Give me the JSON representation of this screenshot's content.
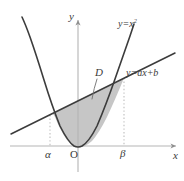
{
  "figure": {
    "type": "math-diagram",
    "background_color": "#ffffff",
    "axes": {
      "x_axis_label": "x",
      "y_axis_label": "y",
      "origin_label": "O",
      "axis_color": "#b0b0b0",
      "origin_px": {
        "x": 78,
        "y": 146
      }
    },
    "curves": {
      "parabola": {
        "label": "y=x",
        "label_exponent": "2",
        "equation": "y = x^2",
        "stroke_color": "#3c3c3c",
        "stroke_width": 1.6
      },
      "line": {
        "label": "y=ax+b",
        "equation": "y = ax + b",
        "stroke_color": "#3c3c3c",
        "stroke_width": 1.6
      }
    },
    "region": {
      "label": "D",
      "fill_color": "#c6c6c6",
      "fill_opacity": 1
    },
    "markers": {
      "left_bound_label": "α",
      "right_bound_label": "β",
      "guide_color": "#bdbdbd",
      "guide_dash": "1.4 2.2",
      "left_intersection_px": {
        "x": 50,
        "y": 115
      },
      "right_intersection_px": {
        "x": 124,
        "y": 78
      }
    },
    "geometry": {
      "parabola_path": "M 22,17 Q 25.5,24.5 30,37 Q 36,54 44,80 Q 52,106 60,126 Q 68,142 74,146 Q 78,148 82,146 Q 89,142 97,126 Q 106,105 115,79 Q 124,53 130,36 Q 133,27 134,24",
      "line_path": "M 11,134 L 175,53",
      "region_path": "M 50,115 L 124,78 Q 115,100 107,117 Q 99,133 92,141 Q 85,147 79,147.5 Q 73,147 67,140 Q 60,130 55,117 Q 52,111 50,115 Z"
    }
  }
}
